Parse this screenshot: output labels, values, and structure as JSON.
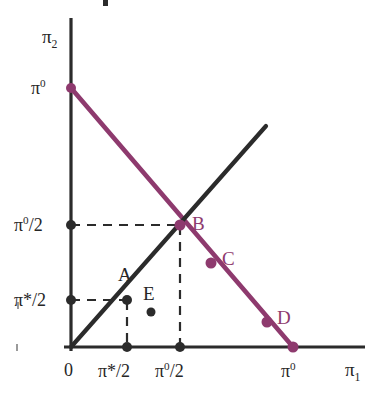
{
  "figure": {
    "type": "line",
    "background_color": "#ffffff",
    "axes": {
      "x_label": "π₁",
      "x_label_base": "π",
      "x_label_sub": "1",
      "y_label_base": "π",
      "y_label_sub": "2",
      "origin_label": "0",
      "axis_color": "#2b2b2b"
    },
    "x_ticks": [
      {
        "id": "x-origin",
        "label": "0",
        "value": 0,
        "px": 71
      },
      {
        "id": "x-pistar-half",
        "base": "π*",
        "sup": "",
        "frac": "/2",
        "label": "π*/2",
        "value": 0.24,
        "px": 127,
        "marker": true
      },
      {
        "id": "x-pi0-half",
        "base": "π",
        "sup": "0",
        "frac": "/2",
        "label": "π0/2",
        "value": 0.5,
        "px": 180,
        "marker": true
      },
      {
        "id": "x-pi0",
        "base": "π",
        "sup": "0",
        "frac": "",
        "label": "π0",
        "value": 1.0,
        "px": 293,
        "marker": true
      }
    ],
    "y_ticks": [
      {
        "id": "y-pi0",
        "base": "π",
        "sup": "0",
        "frac": "",
        "label": "π0",
        "value": 1.0,
        "px": 88,
        "marker": true
      },
      {
        "id": "y-pi0-half",
        "base": "π",
        "sup": "0",
        "frac": "/2",
        "label": "π0/2",
        "value": 0.5,
        "px": 225,
        "marker": true
      },
      {
        "id": "y-pistar-half",
        "base": "π*",
        "sup": "",
        "frac": "/2",
        "label": "π*/2",
        "value": 0.24,
        "px": 300,
        "marker": true
      }
    ],
    "series": [
      {
        "name": "budget-line",
        "color": "#8e3a6e",
        "style": "solid",
        "width": 4,
        "from": {
          "x": 0.0,
          "y": 1.0,
          "px": 71,
          "py": 88
        },
        "to": {
          "x": 1.0,
          "y": 0.0,
          "px": 293,
          "py": 347
        }
      },
      {
        "name": "diagonal-45-line",
        "color": "#2b2b2b",
        "style": "solid",
        "width": 4,
        "from": {
          "x": 0.0,
          "y": 0.0,
          "px": 71,
          "py": 347
        },
        "to": {
          "x": 0.87,
          "y": 0.85,
          "px": 265,
          "py": 127
        }
      }
    ],
    "dashed_guides": [
      {
        "name": "guide-b-horizontal",
        "orientation": "horizontal",
        "from_px": 71,
        "to_px": 182,
        "at_px": 225,
        "color": "#2b2b2b"
      },
      {
        "name": "guide-b-vertical",
        "orientation": "vertical",
        "from_px": 226,
        "to_px": 347,
        "at_px": 180,
        "color": "#2b2b2b"
      },
      {
        "name": "guide-a-horizontal",
        "orientation": "horizontal",
        "from_px": 71,
        "to_px": 128,
        "at_px": 300,
        "color": "#2b2b2b"
      },
      {
        "name": "guide-a-vertical",
        "orientation": "vertical",
        "from_px": 301,
        "to_px": 347,
        "at_px": 127,
        "color": "#2b2b2b"
      }
    ],
    "points": [
      {
        "id": "A",
        "label": "A",
        "color": "#2b2b2b",
        "px": 127,
        "py": 300,
        "x": 0.24,
        "y": 0.24,
        "label_px": 122,
        "label_py": 267,
        "label_color": "#2b2b2b"
      },
      {
        "id": "B",
        "label": "B",
        "color": "#8e3a6e",
        "px": 180,
        "py": 225,
        "x": 0.5,
        "y": 0.5,
        "label_px": 192,
        "label_py": 216,
        "label_color": "#8e3a6e"
      },
      {
        "id": "C",
        "label": "C",
        "color": "#8e3a6e",
        "px": 211,
        "py": 263,
        "x": 0.63,
        "y": 0.37,
        "label_px": 222,
        "label_py": 250,
        "label_color": "#8e3a6e"
      },
      {
        "id": "D",
        "label": "D",
        "color": "#8e3a6e",
        "px": 267,
        "py": 322,
        "x": 0.88,
        "y": 0.12,
        "label_px": 276,
        "label_py": 309,
        "label_color": "#8e3a6e"
      },
      {
        "id": "E",
        "label": "E",
        "color": "#2b2b2b",
        "px": 151,
        "py": 312,
        "x": 0.36,
        "y": 0.135,
        "label_px": 143,
        "label_py": 285,
        "label_color": "#2b2b2b"
      }
    ],
    "endpoint_markers": [
      {
        "name": "marker-y-pi0",
        "px": 71,
        "py": 88,
        "color": "#8e3a6e"
      },
      {
        "name": "marker-y-pi0-half",
        "px": 71,
        "py": 225,
        "color": "#2b2b2b"
      },
      {
        "name": "marker-y-pistar-half",
        "px": 71,
        "py": 300,
        "color": "#2b2b2b"
      },
      {
        "name": "marker-x-pistar-half",
        "px": 127,
        "py": 347,
        "color": "#2b2b2b"
      },
      {
        "name": "marker-x-pi0-half",
        "px": 180,
        "py": 347,
        "color": "#2b2b2b"
      },
      {
        "name": "marker-x-pi0",
        "px": 293,
        "py": 347,
        "color": "#8e3a6e"
      }
    ],
    "artifacts": [
      {
        "name": "scan-speck-top",
        "px": 105,
        "py": 0,
        "w": 4,
        "h": 6
      },
      {
        "name": "scan-speck-left-upper",
        "px": 17,
        "py": 303,
        "w": 2,
        "h": 6
      },
      {
        "name": "scan-speck-left-lower",
        "px": 16,
        "py": 345,
        "w": 2,
        "h": 6
      }
    ]
  }
}
